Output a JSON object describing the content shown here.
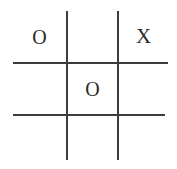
{
  "board": {
    "title": "Tic Tac Toe",
    "background_color": "#ffffff",
    "line_color": "#3c3c3c",
    "mark_color": "#2b2b2b",
    "rows": 3,
    "columns": 3,
    "cells": [
      [
        {
          "name": "cell-top-left",
          "mark": "O"
        },
        {
          "name": "cell-top-center",
          "mark": ""
        },
        {
          "name": "cell-top-right",
          "mark": "X"
        }
      ],
      [
        {
          "name": "cell-middle-left",
          "mark": ""
        },
        {
          "name": "cell-middle-center",
          "mark": "O"
        },
        {
          "name": "cell-middle-right",
          "mark": ""
        }
      ],
      [
        {
          "name": "cell-bottom-left",
          "mark": ""
        },
        {
          "name": "cell-bottom-center",
          "mark": ""
        },
        {
          "name": "cell-bottom-right",
          "mark": ""
        }
      ]
    ]
  }
}
